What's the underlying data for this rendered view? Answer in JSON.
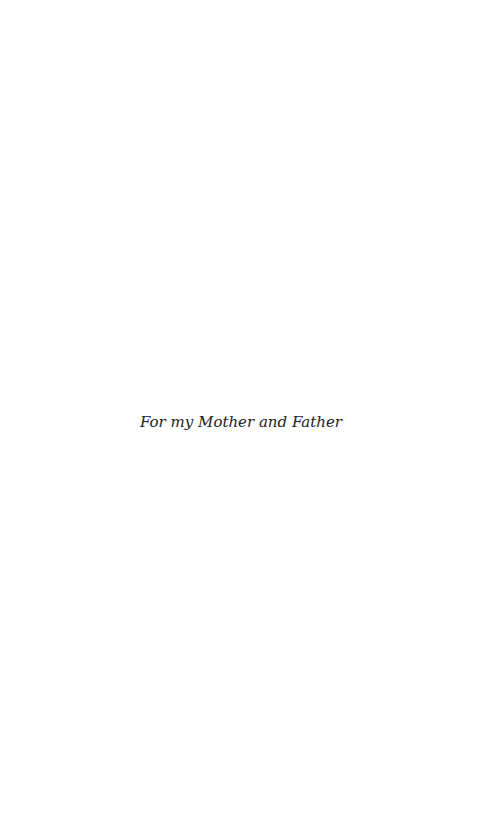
{
  "page": {
    "type": "dedication",
    "dedication_text": "For my Mother and Father"
  },
  "colors": {
    "background": "#ffffff",
    "text": "#222222"
  }
}
